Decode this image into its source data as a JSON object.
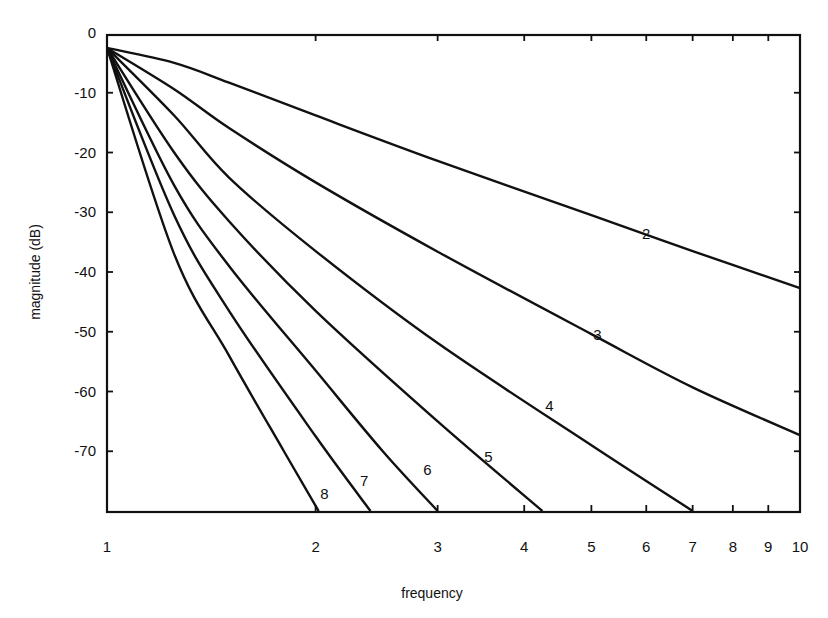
{
  "chart_data": {
    "type": "line",
    "title": "",
    "xlabel": "frequency",
    "ylabel": "magnitude   (dB)",
    "xscale": "log",
    "xlim": [
      1,
      10
    ],
    "ylim": [
      -80,
      0
    ],
    "grid": false,
    "legend": "inline curve labels",
    "x_ticks": [
      1,
      2,
      3,
      4,
      5,
      6,
      7,
      8,
      9,
      10
    ],
    "x_tick_labels": [
      "1",
      "2",
      "3",
      "4",
      "5",
      "6",
      "7",
      "8",
      "9",
      "10"
    ],
    "y_ticks": [
      0,
      -10,
      -20,
      -30,
      -40,
      -50,
      -60,
      -70
    ],
    "y_tick_labels": [
      "0",
      "-10",
      "-20",
      "-30",
      "-40",
      "-50",
      "-60",
      "-70"
    ],
    "series": [
      {
        "name": "2",
        "label_pos": [
          6.0,
          -34.5
        ],
        "x": [
          1,
          1.25,
          1.5,
          2,
          3,
          5,
          7,
          10
        ],
        "values": [
          -2.5,
          -5.0,
          -8.3,
          -13.8,
          -21.4,
          -30.5,
          -36.5,
          -42.7
        ]
      },
      {
        "name": "3",
        "label_pos": [
          5.1,
          -51.3
        ],
        "x": [
          1,
          1.25,
          1.5,
          2,
          3,
          5,
          7,
          10
        ],
        "values": [
          -2.5,
          -9.4,
          -15.9,
          -25.0,
          -36.6,
          -50.4,
          -59.3,
          -67.3
        ]
      },
      {
        "name": "4",
        "label_pos": [
          4.35,
          -63.2
        ],
        "x": [
          1,
          1.25,
          1.5,
          2,
          3,
          5,
          7
        ],
        "values": [
          -2.5,
          -13.8,
          -24.2,
          -36.5,
          -51.9,
          -69.0,
          -80.0
        ]
      },
      {
        "name": "5",
        "label_pos": [
          3.55,
          -71.8
        ],
        "x": [
          1,
          1.25,
          1.5,
          2,
          3,
          4.25
        ],
        "values": [
          -2.5,
          -20.0,
          -31.5,
          -46.5,
          -65.0,
          -80.0
        ]
      },
      {
        "name": "6",
        "label_pos": [
          2.9,
          -74.0
        ],
        "x": [
          1,
          1.25,
          1.5,
          2,
          2.5,
          3.0
        ],
        "values": [
          -2.5,
          -25.5,
          -39.0,
          -56.5,
          -70.0,
          -80.0
        ]
      },
      {
        "name": "7",
        "label_pos": [
          2.35,
          -75.8
        ],
        "x": [
          1,
          1.25,
          1.5,
          2,
          2.4
        ],
        "values": [
          -2.5,
          -30.5,
          -46.5,
          -67.5,
          -80.0
        ]
      },
      {
        "name": "8",
        "label_pos": [
          2.06,
          -78.0
        ],
        "x": [
          1,
          1.25,
          1.5,
          1.8,
          2.02
        ],
        "values": [
          -2.5,
          -37.0,
          -54.0,
          -70.0,
          -80.0
        ]
      }
    ]
  },
  "axes": {
    "x_title": "frequency",
    "y_title": "magnitude   (dB)"
  }
}
